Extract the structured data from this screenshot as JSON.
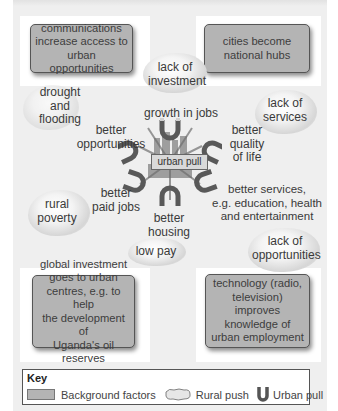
{
  "diagram": {
    "colors": {
      "background": "#efefef",
      "background_factor_box": "#b4b4b4",
      "magnet": "#5a5a5a",
      "cloud": "#d6d6d6"
    },
    "background_factors": [
      {
        "id": "communications",
        "text": "communications increase access to urban opportunities",
        "lines": [
          "communications",
          "increase access to",
          "urban opportunities"
        ]
      },
      {
        "id": "cities-hubs",
        "text": "cities become national hubs",
        "lines": [
          "cities become",
          "national hubs"
        ]
      },
      {
        "id": "global-investment",
        "text": "global investment goes to urban centres, e.g. to help the development of Uganda's oil reserves",
        "lines": [
          "global investment",
          "goes to urban",
          "centres, e.g. to help",
          "the development of",
          "Uganda's oil reserves"
        ]
      },
      {
        "id": "technology",
        "text": "technology (radio, television) improves knowledge of urban employment",
        "lines": [
          "technology (radio,",
          "television) improves",
          "knowledge of",
          "urban employment"
        ]
      }
    ],
    "rural_push": [
      {
        "id": "lack-of-investment",
        "lines": [
          "lack of",
          "investment"
        ]
      },
      {
        "id": "drought-flooding",
        "lines": [
          "drought",
          "and",
          "flooding"
        ]
      },
      {
        "id": "lack-of-services",
        "lines": [
          "lack of",
          "services"
        ]
      },
      {
        "id": "rural-poverty",
        "lines": [
          "rural",
          "poverty"
        ]
      },
      {
        "id": "low-pay",
        "lines": [
          "low pay"
        ]
      },
      {
        "id": "lack-of-opportunities",
        "lines": [
          "lack of",
          "opportunities"
        ]
      }
    ],
    "urban_pull": {
      "center_label": "urban pull",
      "factors": [
        {
          "id": "growth-in-jobs",
          "lines": [
            "growth in jobs"
          ]
        },
        {
          "id": "better-opportunities",
          "lines": [
            "better",
            "opportunities"
          ]
        },
        {
          "id": "better-quality-of-life",
          "lines": [
            "better",
            "quality",
            "of life"
          ]
        },
        {
          "id": "better-paid-jobs",
          "lines": [
            "better",
            "paid jobs"
          ]
        },
        {
          "id": "better-housing",
          "lines": [
            "better",
            "housing"
          ]
        },
        {
          "id": "better-services",
          "lines": [
            "better services,",
            "e.g. education, health",
            "and entertainment"
          ]
        }
      ]
    },
    "key": {
      "title": "Key",
      "items": [
        {
          "label": "Background factors",
          "symbol": "gray-box"
        },
        {
          "label": "Rural push",
          "symbol": "cloud-icon"
        },
        {
          "label": "Urban pull",
          "symbol": "magnet-icon"
        }
      ]
    }
  }
}
